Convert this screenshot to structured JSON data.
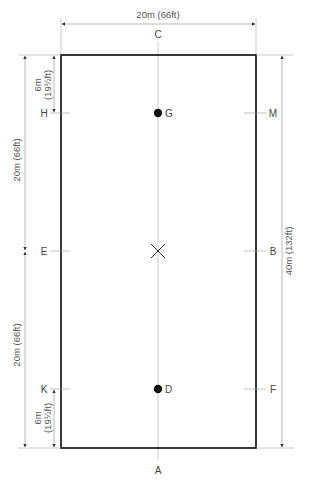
{
  "diagram": {
    "type": "dressage-arena",
    "width_label": "20m (66ft)",
    "length_label": "40m (132ft)",
    "left_dims": {
      "top_6m": "6m",
      "top_6m_ft": "(19½ft)",
      "upper_20m": "20m (66ft)",
      "lower_20m": "20m (66ft)",
      "bottom_6m": "6m",
      "bottom_6m_ft": "(19½ft)"
    },
    "markers": {
      "C": "C",
      "A": "A",
      "H": "H",
      "M": "M",
      "E": "E",
      "B": "B",
      "K": "K",
      "F": "F",
      "G": "G",
      "D": "D"
    },
    "center_mark": "X",
    "colors": {
      "border": "#222222",
      "guide": "#999999",
      "text": "#444444"
    }
  }
}
